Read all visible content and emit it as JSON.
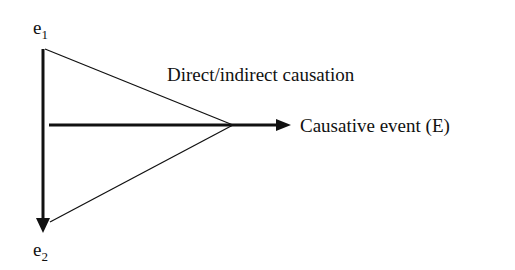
{
  "diagram": {
    "nodes": {
      "e1": {
        "base": "e",
        "subscript": "1"
      },
      "e2": {
        "base": "e",
        "subscript": "2"
      }
    },
    "labels": {
      "relation": "Direct/indirect causation",
      "result": "Causative event (E)"
    },
    "edges": [
      {
        "from": "e1",
        "to": "e2",
        "type": "arrow"
      },
      {
        "from": "e1",
        "to": "apex",
        "type": "line"
      },
      {
        "from": "e2",
        "to": "apex",
        "type": "line"
      },
      {
        "from": "e1-e2 axis",
        "to": "Causative event (E)",
        "type": "arrow"
      }
    ],
    "colors": {
      "line": "#111111",
      "background": "#ffffff"
    }
  }
}
